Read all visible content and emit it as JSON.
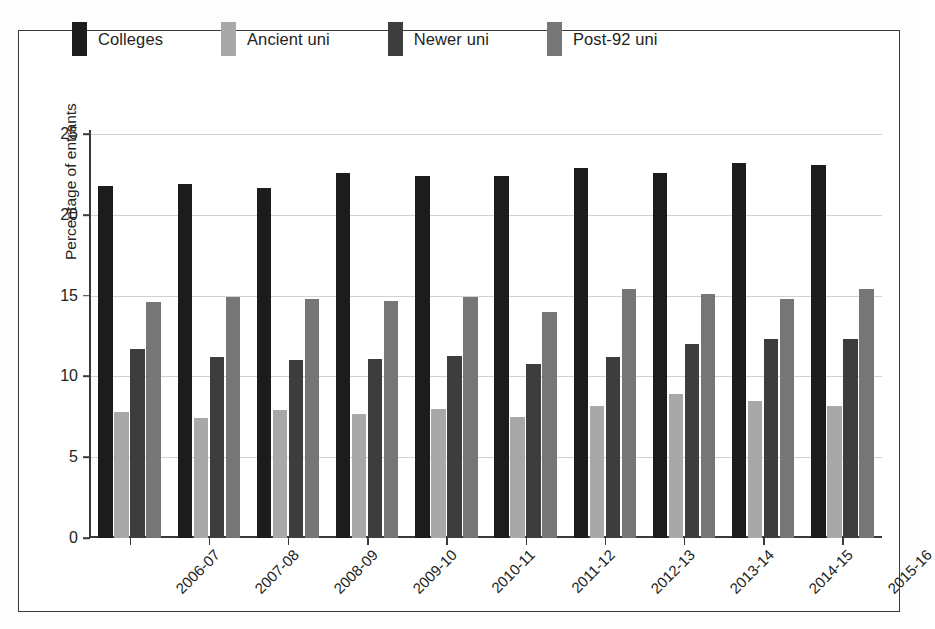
{
  "chart_data": {
    "type": "bar",
    "title": "",
    "xlabel": "",
    "ylabel": "Percentage of entrants",
    "ylim": [
      0,
      26.5
    ],
    "yticks": [
      0,
      5,
      10,
      15,
      20,
      25
    ],
    "ytick_labels": [
      "0",
      "5",
      "10",
      "15",
      "20",
      "25"
    ],
    "grid": true,
    "legend_position": "top",
    "categories": [
      "2006-07",
      "2007-08",
      "2008-09",
      "2009-10",
      "2010-11",
      "2011-12",
      "2012-13",
      "2013-14",
      "2014-15",
      "2015-16"
    ],
    "series": [
      {
        "name": "Colleges",
        "color": "#1c1c1c",
        "values": [
          21.8,
          21.9,
          21.7,
          22.6,
          22.4,
          22.4,
          22.9,
          22.6,
          23.2,
          23.1
        ]
      },
      {
        "name": "Ancient uni",
        "color": "#a8a8a8",
        "values": [
          7.8,
          7.4,
          7.9,
          7.7,
          8.0,
          7.5,
          8.2,
          8.9,
          8.5,
          8.2
        ]
      },
      {
        "name": "Newer uni",
        "color": "#3d3d3d",
        "values": [
          11.7,
          11.2,
          11.0,
          11.1,
          11.3,
          10.8,
          11.2,
          12.0,
          12.3,
          12.3
        ]
      },
      {
        "name": "Post-92 uni",
        "color": "#767676",
        "values": [
          14.6,
          14.9,
          14.8,
          14.7,
          14.9,
          14.0,
          15.4,
          15.1,
          14.8,
          15.4
        ]
      }
    ]
  },
  "colors": {
    "frame": "#3a3a3a",
    "grid": "#d2d2d2",
    "text": "#232323",
    "background": "#ffffff"
  }
}
